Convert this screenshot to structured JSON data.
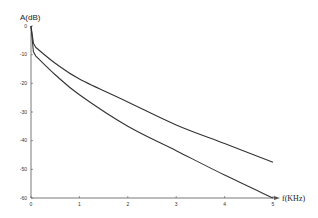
{
  "chart_data": {
    "type": "line",
    "title": "",
    "xlabel": "f(KHz)",
    "ylabel": "A(dB)",
    "xlim": [
      0,
      5
    ],
    "ylim": [
      -60,
      0
    ],
    "x_ticks": [
      "0",
      "1",
      "2",
      "3",
      "4",
      "5"
    ],
    "y_ticks": [
      "0",
      "-10",
      "-20",
      "-30",
      "-40",
      "-50",
      "-60"
    ],
    "grid": false,
    "legend": null,
    "series": [
      {
        "name": "upper curve",
        "x": [
          0,
          0.05,
          0.1,
          0.5,
          1,
          2,
          3,
          4,
          5
        ],
        "values": [
          0,
          -6,
          -7.5,
          -13,
          -18.5,
          -26.5,
          -34.5,
          -41,
          -47.5
        ]
      },
      {
        "name": "lower curve",
        "x": [
          0,
          0.05,
          0.1,
          0.5,
          1,
          2,
          3,
          4,
          5
        ],
        "values": [
          0,
          -9,
          -10.5,
          -17,
          -24,
          -35,
          -43.5,
          -52,
          -60
        ]
      }
    ],
    "line_color": "#333333"
  }
}
